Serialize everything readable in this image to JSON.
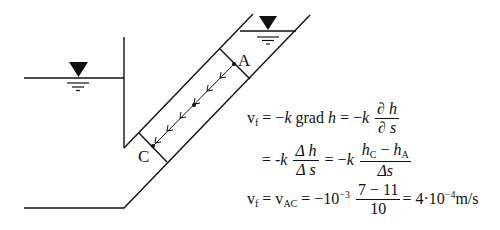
{
  "diagram": {
    "labels": {
      "point_a": "A",
      "point_c": "C"
    },
    "colors": {
      "line": "#111111",
      "background": "#ffffff"
    },
    "icons": {
      "water_level_left": "water-level-triangle",
      "water_level_right": "water-level-triangle"
    }
  },
  "equations": {
    "line1": {
      "lhs": "v",
      "lhs_sub": "f",
      "part1": "= −",
      "k1": "k",
      "grad": " grad ",
      "h1": "h",
      "part2": " = −",
      "k2": "k",
      "num": "∂ h",
      "den": "∂ s"
    },
    "line2": {
      "eq": "=  -",
      "k1": "k",
      "num1": "Δ h",
      "den1": "Δ s",
      "eq2": " = −",
      "k2": "k",
      "num2_h1": "h",
      "num2_sub1": "C",
      "num2_minus": " − ",
      "num2_h2": "h",
      "num2_sub2": "A",
      "den2": "Δs"
    },
    "line3": {
      "lhs": "v",
      "lhs_sub": "f",
      "eq1": " = v",
      "sub2": "AC",
      "eq2": " = −10",
      "exp": "−3",
      "num": "7 − 11",
      "den": "10",
      "result_pre": "=  4·10",
      "result_exp": "−4",
      "unit": "m/s"
    }
  }
}
